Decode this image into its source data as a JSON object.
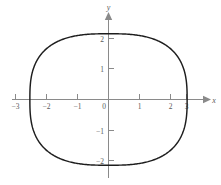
{
  "chart_data": {
    "type": "line",
    "title": "",
    "subtitle": "",
    "xlabel": "x",
    "ylabel": "y",
    "xlim": [
      -3.6,
      3.75
    ],
    "ylim": [
      -2.65,
      2.7
    ],
    "grid": false,
    "legend": null,
    "x_ticks": [
      -3,
      -2,
      -1,
      0,
      1,
      2,
      3
    ],
    "x_tick_labels": [
      "−3",
      "−2",
      "−1",
      "0",
      "1",
      "2",
      "3"
    ],
    "y_ticks": [
      -2,
      -1,
      1,
      2
    ],
    "y_tick_labels": [
      "−2",
      "−1",
      "1",
      "2"
    ],
    "origin_label": "0",
    "curve": {
      "name": "superellipse",
      "shape": "closed-oval",
      "semi_axis_x": 3.12,
      "semi_axis_y": 2.17,
      "exponent": 2.8,
      "center": [
        0,
        0
      ],
      "x_intercepts": [
        -3.12,
        3.12
      ],
      "y_intercepts": [
        -2.17,
        2.17
      ],
      "color": "#1d1d1d"
    },
    "points": [
      {
        "x": 3.12,
        "y": 0
      },
      {
        "x": 3.05,
        "y": 1.0
      },
      {
        "x": 2.8,
        "y": 1.6
      },
      {
        "x": 2.3,
        "y": 1.98
      },
      {
        "x": 1.5,
        "y": 2.13
      },
      {
        "x": 0.0,
        "y": 2.17
      },
      {
        "x": -1.5,
        "y": 2.13
      },
      {
        "x": -2.3,
        "y": 1.98
      },
      {
        "x": -2.8,
        "y": 1.6
      },
      {
        "x": -3.05,
        "y": 1.0
      },
      {
        "x": -3.12,
        "y": 0
      },
      {
        "x": -3.05,
        "y": -1.0
      },
      {
        "x": -2.8,
        "y": -1.6
      },
      {
        "x": -2.3,
        "y": -1.98
      },
      {
        "x": -1.5,
        "y": -2.13
      },
      {
        "x": 0.0,
        "y": -2.17
      },
      {
        "x": 1.5,
        "y": -2.13
      },
      {
        "x": 2.3,
        "y": -1.98
      },
      {
        "x": 2.8,
        "y": -1.6
      },
      {
        "x": 3.05,
        "y": -1.0
      },
      {
        "x": 3.12,
        "y": 0
      }
    ]
  },
  "axes": {
    "x_axis_label": "x",
    "y_axis_label": "y",
    "origin_label": "0"
  },
  "colors": {
    "background": "#ffffff",
    "axis": "#8a8a8a",
    "curve": "#1d1d1d",
    "text": "#5a5a5a"
  }
}
